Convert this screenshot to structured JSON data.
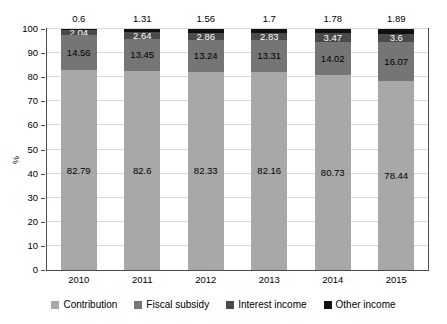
{
  "chart_data": {
    "type": "bar",
    "subtype": "stacked-bar-percent",
    "title": "",
    "xlabel": "",
    "ylabel": "%",
    "ylim": [
      0,
      100
    ],
    "yticks": [
      0,
      10,
      20,
      30,
      40,
      50,
      60,
      70,
      80,
      90,
      100
    ],
    "grid": true,
    "grid_orientation": "horizontal",
    "legend_position": "bottom",
    "categories": [
      "2010",
      "2011",
      "2012",
      "2013",
      "2014",
      "2015"
    ],
    "series": [
      {
        "name": "Contribution",
        "color": "#a8a8a8",
        "label_color": "#000000",
        "values": [
          82.79,
          82.6,
          82.33,
          82.16,
          80.73,
          78.44
        ],
        "labels": [
          "82.79",
          "82.6",
          "82.33",
          "82.16",
          "80.73",
          "78.44"
        ],
        "label_placement": "inside"
      },
      {
        "name": "Fiscal subsidy",
        "color": "#757575",
        "label_color": "#000000",
        "values": [
          14.56,
          13.45,
          13.24,
          13.31,
          14.02,
          16.07
        ],
        "labels": [
          "14.56",
          "13.45",
          "13.24",
          "13.31",
          "14.02",
          "16.07"
        ],
        "label_placement": "inside"
      },
      {
        "name": "Interest income",
        "color": "#4a4a4a",
        "label_color": "#ffffff",
        "values": [
          2.04,
          2.64,
          2.86,
          2.83,
          3.47,
          3.6
        ],
        "labels": [
          "2.04",
          "2.64",
          "2.86",
          "2.83",
          "3.47",
          "3.6"
        ],
        "label_placement": "inside"
      },
      {
        "name": "Other income",
        "color": "#111111",
        "label_color": "#000000",
        "values": [
          0.6,
          1.31,
          1.56,
          1.7,
          1.78,
          1.89
        ],
        "labels": [
          "0.6",
          "1.31",
          "1.56",
          "1.7",
          "1.78",
          "1.89"
        ],
        "label_placement": "above"
      }
    ]
  },
  "legend": {
    "items": [
      {
        "label": "Contribution",
        "color": "#a8a8a8"
      },
      {
        "label": "Fiscal subsidy",
        "color": "#757575"
      },
      {
        "label": "Interest income",
        "color": "#4a4a4a"
      },
      {
        "label": "Other income",
        "color": "#111111"
      }
    ]
  },
  "axis": {
    "y_label": "%",
    "y_tick_labels": [
      "100",
      "90",
      "80",
      "70",
      "60",
      "50",
      "40",
      "30",
      "20",
      "10",
      "0"
    ],
    "x_tick_labels": [
      "2010",
      "2011",
      "2012",
      "2013",
      "2014",
      "2015"
    ]
  }
}
